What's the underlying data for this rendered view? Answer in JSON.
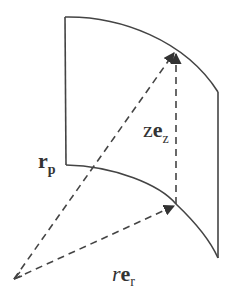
{
  "diagram": {
    "type": "vector-decomposition-cylindrical",
    "colors": {
      "stroke": "#444444",
      "text": "#333333",
      "background": "#ffffff"
    },
    "surface": {
      "description": "curved cylindrical surface patch",
      "corners": {
        "top_left": [
          65,
          17
        ],
        "bottom_left": [
          68,
          165
        ],
        "top_right": [
          218,
          92
        ],
        "bottom_right": [
          218,
          258
        ]
      }
    },
    "points": {
      "origin": [
        14,
        279
      ],
      "radial_tip": [
        176,
        205
      ],
      "position_tip": [
        176,
        50
      ]
    },
    "vectors": [
      {
        "id": "rp",
        "from": "origin",
        "to": "position_tip",
        "style": "dashed",
        "arrowhead": true
      },
      {
        "id": "rer",
        "from": "origin",
        "to": "radial_tip",
        "style": "dashed",
        "arrowhead": true
      },
      {
        "id": "zez",
        "from": "radial_tip",
        "to": "position_tip",
        "style": "dashed",
        "arrowhead": true
      }
    ],
    "labels": {
      "rp": {
        "main": "r",
        "sub": "p"
      },
      "zez": {
        "coef": "z",
        "main": "e",
        "sub": "z"
      },
      "rer": {
        "coef": "r",
        "main": "e",
        "sub": "r"
      }
    }
  }
}
